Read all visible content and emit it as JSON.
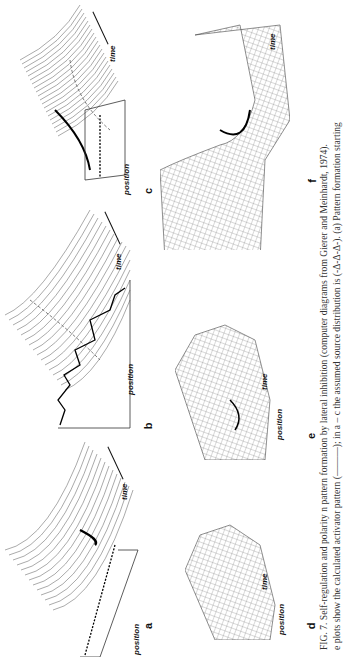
{
  "figure": {
    "number": "FIG. 7.",
    "caption_line1": "FIG. 7. Self-regulation and polarity  n pattern formation by lateral inhibition (computer diagrams from Gierer and Meinhardt, 1974).",
    "caption_line2": "e plots show the calculated activator pattern (———); in a – c the assumed source distribution is (-Δ-Δ-Δ-). (a) Pattern formation starting"
  },
  "panels": [
    {
      "id": "a",
      "label": "a",
      "axis_position": "position",
      "axis_time": "time",
      "style": "line-stack"
    },
    {
      "id": "b",
      "label": "b",
      "axis_position": "position",
      "axis_time": "time",
      "style": "line-stack"
    },
    {
      "id": "c",
      "label": "c",
      "axis_position": "position",
      "axis_time": "time",
      "style": "line-stack"
    },
    {
      "id": "d",
      "label": "d",
      "axis_position": "position",
      "axis_time": "time",
      "style": "mesh"
    },
    {
      "id": "e",
      "label": "e",
      "axis_position": "position",
      "axis_time": "time",
      "style": "mesh"
    },
    {
      "id": "f",
      "label": "f",
      "axis_position": "position",
      "axis_time": "time",
      "style": "mesh"
    }
  ]
}
